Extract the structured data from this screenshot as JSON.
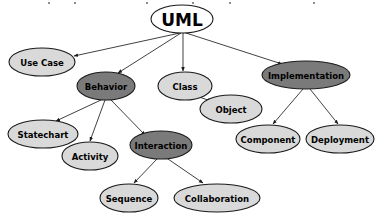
{
  "diagram": {
    "type": "tree-graph",
    "colors": {
      "fill_light": "#d9d9d9",
      "fill_dark": "#7a7a7a",
      "stroke": "#1a1a1a",
      "edge": "#2b2b2b",
      "text": "#000000",
      "background": "#ffffff"
    },
    "nodes": [
      {
        "id": "uml",
        "label": "UML",
        "shade": "white",
        "cx": 182,
        "cy": 19,
        "rx": 31,
        "ry": 14,
        "font_size": 17
      },
      {
        "id": "use_case",
        "label": "Use Case",
        "shade": "light",
        "cx": 42,
        "cy": 62,
        "rx": 33,
        "ry": 14,
        "font_size": 8.5
      },
      {
        "id": "behavior",
        "label": "Behavior",
        "shade": "dark",
        "cx": 106,
        "cy": 86,
        "rx": 29,
        "ry": 14,
        "font_size": 8.5
      },
      {
        "id": "class",
        "label": "Class",
        "shade": "light",
        "cx": 185,
        "cy": 86,
        "rx": 27,
        "ry": 14,
        "font_size": 8.5
      },
      {
        "id": "object",
        "label": "Object",
        "shade": "light",
        "cx": 231,
        "cy": 109,
        "rx": 31,
        "ry": 14,
        "font_size": 8.5
      },
      {
        "id": "implementation",
        "label": "Implementation",
        "shade": "dark",
        "cx": 306,
        "cy": 75,
        "rx": 44,
        "ry": 14,
        "font_size": 8.5
      },
      {
        "id": "statechart",
        "label": "Statechart",
        "shade": "light",
        "cx": 43,
        "cy": 134,
        "rx": 35,
        "ry": 14,
        "font_size": 8.5
      },
      {
        "id": "activity",
        "label": "Activity",
        "shade": "light",
        "cx": 90,
        "cy": 156,
        "rx": 28,
        "ry": 14,
        "font_size": 8.5
      },
      {
        "id": "interaction",
        "label": "Interaction",
        "shade": "dark",
        "cx": 161,
        "cy": 145,
        "rx": 31,
        "ry": 14,
        "font_size": 8.5
      },
      {
        "id": "component",
        "label": "Component",
        "shade": "light",
        "cx": 268,
        "cy": 139,
        "rx": 32,
        "ry": 14,
        "font_size": 8.5
      },
      {
        "id": "deployment",
        "label": "Deployment",
        "shade": "light",
        "cx": 340,
        "cy": 139,
        "rx": 34,
        "ry": 14,
        "font_size": 8.5
      },
      {
        "id": "sequence",
        "label": "Sequence",
        "shade": "light",
        "cx": 129,
        "cy": 198,
        "rx": 29,
        "ry": 14,
        "font_size": 8.5
      },
      {
        "id": "collaboration",
        "label": "Collaboration",
        "shade": "light",
        "cx": 217,
        "cy": 198,
        "rx": 43,
        "ry": 14,
        "font_size": 8.5
      }
    ],
    "edges": [
      {
        "from": "uml",
        "to": "use_case",
        "x1": 180,
        "y1": 33,
        "x2": 74,
        "y2": 56
      },
      {
        "from": "uml",
        "to": "behavior",
        "x1": 181,
        "y1": 33,
        "x2": 118,
        "y2": 73
      },
      {
        "from": "uml",
        "to": "class",
        "x1": 183,
        "y1": 33,
        "x2": 183,
        "y2": 71
      },
      {
        "from": "uml",
        "to": "implementation",
        "x1": 186,
        "y1": 33,
        "x2": 282,
        "y2": 64
      },
      {
        "from": "class",
        "to": "object",
        "x1": 196,
        "y1": 96,
        "x2": 211,
        "y2": 101
      },
      {
        "from": "behavior",
        "to": "statechart",
        "x1": 101,
        "y1": 100,
        "x2": 56,
        "y2": 121
      },
      {
        "from": "behavior",
        "to": "activity",
        "x1": 105,
        "y1": 100,
        "x2": 90,
        "y2": 141
      },
      {
        "from": "behavior",
        "to": "interaction",
        "x1": 111,
        "y1": 100,
        "x2": 145,
        "y2": 135
      },
      {
        "from": "implementation",
        "to": "component",
        "x1": 303,
        "y1": 89,
        "x2": 273,
        "y2": 124
      },
      {
        "from": "implementation",
        "to": "deployment",
        "x1": 310,
        "y1": 89,
        "x2": 338,
        "y2": 124
      },
      {
        "from": "interaction",
        "to": "sequence",
        "x1": 157,
        "y1": 159,
        "x2": 134,
        "y2": 183
      },
      {
        "from": "interaction",
        "to": "collaboration",
        "x1": 168,
        "y1": 159,
        "x2": 203,
        "y2": 183
      }
    ],
    "top_specks": [
      {
        "x": 48,
        "y": 2
      },
      {
        "x": 74,
        "y": 2
      },
      {
        "x": 146,
        "y": 2
      },
      {
        "x": 192,
        "y": 2
      },
      {
        "x": 229,
        "y": 2
      },
      {
        "x": 313,
        "y": 2
      }
    ]
  }
}
